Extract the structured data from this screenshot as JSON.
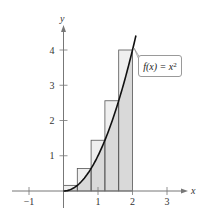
{
  "chart_data": {
    "type": "area",
    "title": "",
    "function_label": "f(x) = x",
    "function_exponent": "2",
    "xlabel": "x",
    "ylabel": "y",
    "xlim": [
      -1.5,
      3.6
    ],
    "ylim": [
      -0.5,
      4.5
    ],
    "x_ticks": [
      -1,
      1,
      2,
      3
    ],
    "x_tick_labels": [
      "−1",
      "1",
      "2",
      "3"
    ],
    "y_ticks": [
      1,
      2,
      3,
      4
    ],
    "y_tick_labels": [
      "1",
      "2",
      "3",
      "4"
    ],
    "grid": false,
    "curve": {
      "name": "f(x) = x^2",
      "x_range": [
        0,
        2.1
      ]
    },
    "rectangles": {
      "description": "Upper (circumscribed) rectangles, n = 5 on [0, 2], right endpoints",
      "width": 0.4,
      "x_left": [
        0,
        0.4,
        0.8,
        1.2,
        1.6
      ],
      "heights": [
        0.16,
        0.64,
        1.44,
        2.56,
        4
      ]
    },
    "colors": {
      "rect_fill": "#efefef",
      "under_curve_fill": "#d9d9d9",
      "curve": "#111111",
      "axis": "#777777"
    }
  }
}
